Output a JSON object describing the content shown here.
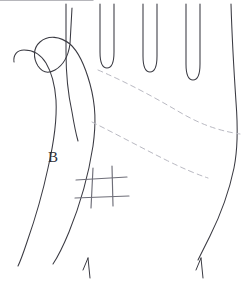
{
  "figure": {
    "background_color": "#ffffff",
    "canvas": {
      "width": 252,
      "height": 288
    }
  },
  "labels": [
    {
      "id": "region-b",
      "text": "B",
      "x": 48,
      "y": 150,
      "font_size_px": 15,
      "color": "#2e2e36"
    }
  ],
  "colors": {
    "outline": "#3a3a42",
    "crease": "#b9b9c2",
    "grid": "#6e6e78",
    "label": "#2e2e36",
    "background": "#ffffff"
  },
  "strokes": {
    "outline_width": 1.05,
    "crease_width": 1.0,
    "grid_width": 1.15,
    "crease_dash": "5 4"
  },
  "paths": {
    "thumb_and_left_edge": "M 72 8 L 70 44 C 68 58 62 66 55 70 C 48 74 42 72 38 66 C 33 58 33 48 40 42 C 48 35 60 36 70 44 C 79 52 85 66 90 84 C 96 106 96 124 93 146 C 89 172 80 205 69 232 C 62 249 57 258 53 264",
    "thumb_outer": "M 14 62 C 13 55 17 50 24 50 C 33 50 41 55 46 63 C 52 73 55 86 56 100 C 57 118 54 142 48 168 C 42 196 34 222 27 242 C 23 254 20 262 18 266",
    "index_finger_left": "M 66 4 L 66 52 C 66 74 68 94 72 112 C 74 124 76 134 78 141",
    "valley_index_middle": "M 100 4 L 100 52 C 100 62 102 68 107 68 C 112 68 114 62 114 52 L 114 4",
    "valley_middle_ring": "M 143 4 L 143 56 C 143 66 145 72 150 72 C 155 72 157 66 157 56 L 157 4",
    "valley_ring_pinky": "M 186 4 L 186 64 C 186 74 188 80 193 80 C 198 80 200 74 200 64 L 200 4",
    "pinky_right_edge": "M 231 4 C 232 38 234 72 236 102 C 238 128 238 148 234 168 C 229 192 220 216 210 236 C 205 246 201 254 198 260",
    "crease_heart_line": "M 98 70 C 126 82 152 96 176 110 C 196 122 214 130 240 134",
    "crease_head_line": "M 92 122 C 116 134 142 148 166 160 C 182 168 196 174 208 178"
  },
  "grid_marks": {
    "description": "hash / tic-tac-toe mark on palm",
    "vertical_lines": [
      {
        "x1": 93,
        "y1": 168,
        "x2": 91,
        "y2": 208
      },
      {
        "x1": 112,
        "y1": 166,
        "x2": 113,
        "y2": 206
      }
    ],
    "horizontal_lines": [
      {
        "x1": 76,
        "y1": 180,
        "x2": 127,
        "y2": 177
      },
      {
        "x1": 75,
        "y1": 198,
        "x2": 129,
        "y2": 196
      }
    ]
  },
  "wrist_ticks": [
    {
      "id": "left-wrist-tick",
      "lines": [
        {
          "x1": 88,
          "y1": 258,
          "x2": 90,
          "y2": 278
        },
        {
          "x1": 88,
          "y1": 258,
          "x2": 83,
          "y2": 270
        }
      ]
    },
    {
      "id": "right-wrist-tick",
      "lines": [
        {
          "x1": 201,
          "y1": 258,
          "x2": 203,
          "y2": 278
        },
        {
          "x1": 201,
          "y1": 258,
          "x2": 196,
          "y2": 270
        }
      ]
    }
  ]
}
